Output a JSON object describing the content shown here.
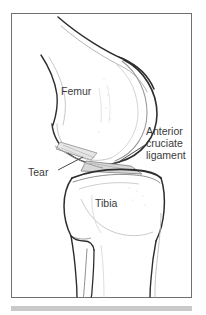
{
  "figure": {
    "frame": {
      "border_color": "#6f6f6f",
      "background": "#ffffff"
    },
    "footer_rule_color": "#c9c9c9",
    "ink_color": "#3a3a3a",
    "bone_outline_color": "#2e2e2e",
    "shading_color": "#d4d4d4",
    "labels": [
      {
        "id": "femur",
        "text": "Femur",
        "x": 61,
        "y": 91,
        "has_leader": false
      },
      {
        "id": "anterior-cruciate-ligament",
        "text": "Anterior cruciate ligament",
        "lines": [
          "Anterior",
          "cruciate",
          "ligament"
        ],
        "x": 146,
        "y": 130,
        "has_leader": true
      },
      {
        "id": "tear",
        "text": "Tear",
        "x": 28,
        "y": 172,
        "has_leader": true
      },
      {
        "id": "tibia",
        "text": "Tibia",
        "x": 95,
        "y": 203,
        "has_leader": false
      }
    ]
  }
}
